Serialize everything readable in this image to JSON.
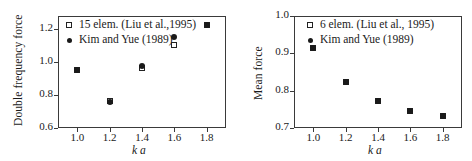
{
  "figure": {
    "panels": [
      {
        "id": "left",
        "ylabel": "Double frequency force",
        "xlabel": "k a",
        "legend": [
          "15 elem. (Liu et al.,1995)",
          "Kim and Yue (1989)"
        ],
        "yticks": [
          "0.6",
          "0.8",
          "1.0",
          "1.2"
        ],
        "xticks": [
          "1.0",
          "1.2",
          "1.4",
          "1.6",
          "1.8"
        ]
      },
      {
        "id": "right",
        "ylabel": "Mean force",
        "xlabel": "k a",
        "legend": [
          "6 elem. (Liu et al., 1995)",
          "Kim and Yue (1989)"
        ],
        "yticks": [
          "0.7",
          "0.8",
          "0.9",
          "1.0"
        ],
        "xticks": [
          "1.0",
          "1.2",
          "1.4",
          "1.6",
          "1.8"
        ]
      }
    ]
  },
  "chart_data": [
    {
      "type": "scatter",
      "title": "",
      "xlabel": "k a",
      "ylabel": "Double frequency force",
      "xlim": [
        0.88,
        1.92
      ],
      "ylim": [
        0.6,
        1.28
      ],
      "xticks": [
        1.0,
        1.2,
        1.4,
        1.6,
        1.8
      ],
      "yticks": [
        0.6,
        0.8,
        1.0,
        1.2
      ],
      "grid": false,
      "legend_position": "top-left",
      "x": [
        1.0,
        1.2,
        1.4,
        1.6,
        1.8
      ],
      "series": [
        {
          "name": "15 elem. (Liu et al.,1995)",
          "marker": "open-square",
          "values": [
            0.955,
            0.765,
            0.965,
            1.105,
            1.225
          ]
        },
        {
          "name": "Kim and Yue (1989)",
          "marker": "filled-circle",
          "values": [
            0.955,
            0.76,
            0.975,
            1.155,
            1.225
          ]
        }
      ]
    },
    {
      "type": "scatter",
      "title": "",
      "xlabel": "k a",
      "ylabel": "Mean force",
      "xlim": [
        0.88,
        1.92
      ],
      "ylim": [
        0.7,
        1.0
      ],
      "xticks": [
        1.0,
        1.2,
        1.4,
        1.6,
        1.8
      ],
      "yticks": [
        0.7,
        0.8,
        0.9,
        1.0
      ],
      "grid": false,
      "legend_position": "top-right",
      "x": [
        1.0,
        1.2,
        1.4,
        1.6,
        1.8
      ],
      "series": [
        {
          "name": "6 elem. (Liu et al., 1995)",
          "marker": "open-square",
          "values": [
            0.915,
            0.824,
            0.771,
            0.745,
            0.731
          ]
        },
        {
          "name": "Kim and Yue (1989)",
          "marker": "filled-circle",
          "values": [
            0.915,
            0.824,
            0.771,
            0.745,
            0.731
          ]
        }
      ]
    }
  ]
}
